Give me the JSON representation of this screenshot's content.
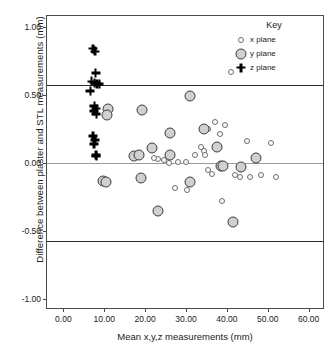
{
  "chart_data": {
    "type": "scatter",
    "title": "",
    "xlabel": "Mean x,y,z measurements (mm)",
    "ylabel": "Difference between plaster and STL measurements (mm)",
    "xlim": [
      -4.0,
      64.0
    ],
    "ylim": [
      -1.08,
      1.08
    ],
    "xticks": [
      0,
      10,
      20,
      30,
      40,
      50,
      60
    ],
    "xtick_labels": [
      "0.00",
      "10.00",
      "20.00",
      "30.00",
      "40.00",
      "50.00",
      "60.00"
    ],
    "yticks": [
      1.0,
      0.5,
      0.0,
      -0.5,
      -1.0
    ],
    "ytick_labels": [
      "1.00",
      "0.50",
      "0.00",
      "-0.50",
      "-1.00"
    ],
    "grid": false,
    "legend": {
      "title": "Key",
      "position": "top-right",
      "entries": [
        {
          "label": "x plane",
          "marker": "open-circle-small",
          "color": "#fdfdfd"
        },
        {
          "label": "y plane",
          "marker": "filled-circle-large",
          "color": "#d0d0d0"
        },
        {
          "label": "z plane",
          "marker": "bold-plus",
          "color": "#000000"
        }
      ]
    },
    "reference_lines": [
      {
        "name": "upper-limit-of-agreement",
        "y": 0.57,
        "style": "solid-black"
      },
      {
        "name": "mean-difference",
        "y": 0.0,
        "style": "solid-gray"
      },
      {
        "name": "lower-limit-of-agreement",
        "y": -0.57,
        "style": "solid-black"
      }
    ],
    "series": [
      {
        "name": "x plane",
        "marker": "open-circle-small",
        "points": [
          [
            41.1,
            0.67
          ],
          [
            37.2,
            0.3
          ],
          [
            39.5,
            0.28
          ],
          [
            35.3,
            0.25
          ],
          [
            38.3,
            0.21
          ],
          [
            33.7,
            0.12
          ],
          [
            34.4,
            0.09
          ],
          [
            45.0,
            0.16
          ],
          [
            50.8,
            0.15
          ],
          [
            32.3,
            0.06
          ],
          [
            34.6,
            0.06
          ],
          [
            30.0,
            0.01
          ],
          [
            28.1,
            0.01
          ],
          [
            25.9,
            0.0
          ],
          [
            23.2,
            0.03
          ],
          [
            24.5,
            0.02
          ],
          [
            35.5,
            -0.05
          ],
          [
            36.4,
            -0.08
          ],
          [
            27.4,
            -0.18
          ],
          [
            30.3,
            -0.2
          ],
          [
            38.8,
            -0.28
          ],
          [
            41.9,
            -0.09
          ],
          [
            43.2,
            -0.1
          ],
          [
            45.7,
            -0.1
          ],
          [
            48.3,
            -0.09
          ],
          [
            51.9,
            -0.1
          ],
          [
            22.2,
            0.04
          ],
          [
            43.8,
            -0.03
          ]
        ]
      },
      {
        "name": "y plane",
        "marker": "filled-circle-large",
        "points": [
          [
            31.0,
            0.49
          ],
          [
            10.9,
            0.4
          ],
          [
            19.3,
            0.39
          ],
          [
            10.7,
            0.35
          ],
          [
            34.5,
            0.25
          ],
          [
            26.2,
            0.22
          ],
          [
            37.5,
            0.12
          ],
          [
            21.6,
            0.11
          ],
          [
            26.1,
            0.06
          ],
          [
            17.3,
            0.05
          ],
          [
            18.6,
            0.06
          ],
          [
            47.2,
            0.04
          ],
          [
            38.6,
            -0.02
          ],
          [
            39.0,
            -0.02
          ],
          [
            43.5,
            -0.03
          ],
          [
            9.6,
            -0.13
          ],
          [
            10.4,
            -0.14
          ],
          [
            19.0,
            -0.11
          ],
          [
            30.9,
            -0.14
          ],
          [
            23.2,
            -0.35
          ],
          [
            41.5,
            -0.43
          ]
        ]
      },
      {
        "name": "z plane",
        "marker": "bold-plus",
        "points": [
          [
            7.3,
            0.84
          ],
          [
            7.7,
            0.82
          ],
          [
            7.9,
            0.66
          ],
          [
            6.9,
            0.6
          ],
          [
            7.6,
            0.59
          ],
          [
            8.2,
            0.58
          ],
          [
            8.8,
            0.58
          ],
          [
            6.6,
            0.53
          ],
          [
            7.6,
            0.42
          ],
          [
            8.0,
            0.4
          ],
          [
            7.5,
            0.38
          ],
          [
            8.1,
            0.36
          ],
          [
            7.2,
            0.2
          ],
          [
            7.8,
            0.17
          ],
          [
            7.5,
            0.14
          ],
          [
            8.0,
            0.06
          ],
          [
            8.1,
            0.05
          ]
        ]
      }
    ]
  }
}
